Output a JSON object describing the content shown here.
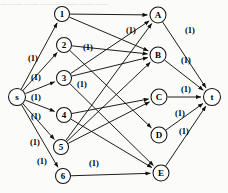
{
  "figure": {
    "title_strip": "— —— —— ——— —— —— ——",
    "width": 228,
    "height": 193,
    "background": "#fbfbfa",
    "stroke_color": "#111111",
    "node_fill": "#ffffff"
  },
  "graph": {
    "type": "bipartite-flow-network",
    "source": {
      "id": "s",
      "label": "s",
      "x": 17,
      "y": 97,
      "r": 8.5
    },
    "sink": {
      "id": "t",
      "label": "t",
      "x": 212,
      "y": 97,
      "r": 8.5
    },
    "left_nodes": [
      {
        "id": "1",
        "label": "1",
        "x": 62,
        "y": 14,
        "r": 7.5
      },
      {
        "id": "2",
        "label": "2",
        "x": 64,
        "y": 45,
        "r": 7.5
      },
      {
        "id": "3",
        "label": "3",
        "x": 64,
        "y": 78,
        "r": 7.5
      },
      {
        "id": "4",
        "label": "4",
        "x": 64,
        "y": 115,
        "r": 7.5
      },
      {
        "id": "5",
        "label": "5",
        "x": 61,
        "y": 147,
        "r": 7.5
      },
      {
        "id": "6",
        "label": "6",
        "x": 63,
        "y": 176,
        "r": 7.5
      }
    ],
    "right_nodes": [
      {
        "id": "A",
        "label": "A",
        "x": 158,
        "y": 15,
        "r": 8
      },
      {
        "id": "B",
        "label": "B",
        "x": 158,
        "y": 55,
        "r": 8
      },
      {
        "id": "C",
        "label": "C",
        "x": 159,
        "y": 97,
        "r": 8
      },
      {
        "id": "D",
        "label": "D",
        "x": 159,
        "y": 135,
        "r": 8
      },
      {
        "id": "E",
        "label": "E",
        "x": 161,
        "y": 173,
        "r": 8
      }
    ],
    "capacity_text": "(1)",
    "edges_source": [
      {
        "from": "s",
        "to": "1",
        "capacity": "(1)",
        "label_x": 33,
        "label_y": 58
      },
      {
        "from": "s",
        "to": "2",
        "capacity": "(1)",
        "label_x": 36,
        "label_y": 77
      },
      {
        "from": "s",
        "to": "3",
        "capacity": "(1)",
        "label_x": 36,
        "label_y": 97
      },
      {
        "from": "s",
        "to": "4",
        "capacity": "(1)",
        "label_x": 36,
        "label_y": 116
      },
      {
        "from": "s",
        "to": "5",
        "capacity": "(1)",
        "label_x": 35,
        "label_y": 142
      },
      {
        "from": "s",
        "to": "6",
        "capacity": "(1)",
        "label_x": 42,
        "label_y": 161
      }
    ],
    "edges_middle": [
      {
        "from": "1",
        "to": "A",
        "capacity": ""
      },
      {
        "from": "1",
        "to": "B",
        "capacity": ""
      },
      {
        "from": "2",
        "to": "B",
        "capacity": "(1)",
        "label_x": 88,
        "label_y": 47
      },
      {
        "from": "2",
        "to": "D",
        "capacity": ""
      },
      {
        "from": "3",
        "to": "A",
        "capacity": "(1)",
        "label_x": 131,
        "label_y": 30
      },
      {
        "from": "3",
        "to": "B",
        "capacity": "(1)",
        "label_x": 82,
        "label_y": 84
      },
      {
        "from": "3",
        "to": "E",
        "capacity": ""
      },
      {
        "from": "4",
        "to": "C",
        "capacity": ""
      },
      {
        "from": "4",
        "to": "E",
        "capacity": ""
      },
      {
        "from": "5",
        "to": "A",
        "capacity": ""
      },
      {
        "from": "5",
        "to": "B",
        "capacity": ""
      },
      {
        "from": "5",
        "to": "C",
        "capacity": ""
      },
      {
        "from": "6",
        "to": "E",
        "capacity": "(1)",
        "label_x": 94,
        "label_y": 163
      }
    ],
    "edges_sink": [
      {
        "from": "A",
        "to": "t",
        "capacity": "(1)",
        "label_x": 190,
        "label_y": 30
      },
      {
        "from": "B",
        "to": "t",
        "capacity": "(1)",
        "label_x": 186,
        "label_y": 60
      },
      {
        "from": "C",
        "to": "t",
        "capacity": "(1)",
        "label_x": 186,
        "label_y": 89
      },
      {
        "from": "D",
        "to": "t",
        "capacity": "(1)",
        "label_x": 180,
        "label_y": 113
      },
      {
        "from": "E",
        "to": "t",
        "capacity": "(1)",
        "label_x": 184,
        "label_y": 131
      }
    ]
  }
}
